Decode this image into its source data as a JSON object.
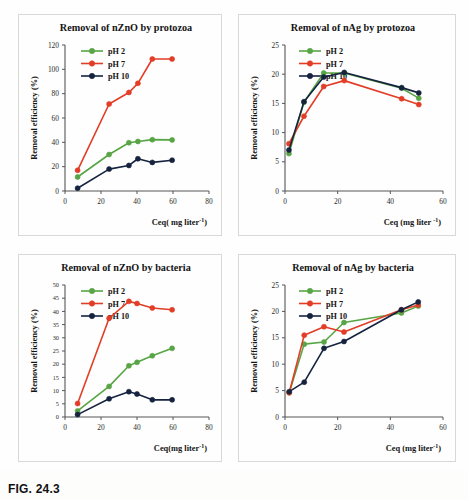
{
  "figure": {
    "caption": "FIG. 24.3",
    "series_colors": {
      "pH 2": "#57a544",
      "pH 7": "#e23d26",
      "pH 10": "#16233f"
    }
  },
  "panels": [
    {
      "id": "nzno-protozoa",
      "title": "Removal of nZnO by protozoa",
      "xlabel": "Ceq( mg liter-1)",
      "ylabel": "Removal efficiency (%)",
      "legend": [
        "pH 2",
        "pH 7",
        "pH 10"
      ]
    },
    {
      "id": "nag-protozoa",
      "title": "Removal of nAg by protozoa",
      "xlabel": "Ceq (mg liter -1)",
      "ylabel": "Removal efficiency (%)",
      "legend": [
        "pH 2",
        "pH 7",
        "pH 10"
      ]
    },
    {
      "id": "nzno-bacteria",
      "title": "Removal of nZnO by bacteria",
      "xlabel": "Ceq(mg liter-1)",
      "ylabel": "Removal efficiency (%)",
      "legend": [
        "pH 2",
        "pH 7",
        "pH 10"
      ]
    },
    {
      "id": "nag-bacteria",
      "title": "Removal of nAg by bacteria",
      "xlabel": "Ceq (mg liter-1)",
      "ylabel": "Removal efficiency (%)",
      "legend": [
        "pH 2",
        "pH 7",
        "pH 10"
      ]
    }
  ],
  "chart_data": [
    {
      "type": "line",
      "id": "nzno-protozoa",
      "title": "Removal of nZnO by protozoa",
      "xlabel": "Ceq( mg liter-1)",
      "ylabel": "Removal efficiency (%)",
      "xlim": [
        0,
        80
      ],
      "ylim": [
        0,
        120
      ],
      "xticks": [
        0,
        20,
        40,
        60,
        80
      ],
      "yticks": [
        0,
        20,
        40,
        60,
        80,
        100,
        120
      ],
      "grid": false,
      "legend_position": "top-left",
      "series": [
        {
          "name": "pH 2",
          "color": "#57a544",
          "x": [
            7,
            24.5,
            35.5,
            40.5,
            48.5,
            59.5
          ],
          "values": [
            11.5,
            30.0,
            39.7,
            40.7,
            42.2,
            42.0
          ]
        },
        {
          "name": "pH 7",
          "color": "#e23d26",
          "x": [
            7,
            24.5,
            35.5,
            40.5,
            48.5,
            59.5
          ],
          "values": [
            17.0,
            71.5,
            81.0,
            88.5,
            108.5,
            108.5
          ]
        },
        {
          "name": "pH 10",
          "color": "#16233f",
          "x": [
            7,
            24.5,
            35.5,
            40.5,
            48.5,
            59.5
          ],
          "values": [
            2.3,
            18.0,
            21.0,
            26.5,
            23.5,
            25.3
          ]
        }
      ]
    },
    {
      "type": "line",
      "id": "nag-protozoa",
      "title": "Removal of nAg by protozoa",
      "xlabel": "Ceq (mg liter -1)",
      "ylabel": "Removal efficiency (%)",
      "xlim": [
        0,
        60
      ],
      "ylim": [
        0,
        25
      ],
      "xticks": [
        0,
        20,
        40,
        60
      ],
      "yticks": [
        0,
        5,
        10,
        15,
        20,
        25
      ],
      "grid": false,
      "legend_position": "top-left",
      "series": [
        {
          "name": "pH 2",
          "color": "#57a544",
          "x": [
            1.5,
            7.2,
            14.7,
            22.5,
            44.3,
            50.8
          ],
          "values": [
            6.4,
            15.2,
            20.2,
            20.2,
            17.6,
            15.9
          ]
        },
        {
          "name": "pH 7",
          "color": "#e23d26",
          "x": [
            1.5,
            7.2,
            14.7,
            22.5,
            44.3,
            50.8
          ],
          "values": [
            8.1,
            12.8,
            17.9,
            18.9,
            15.8,
            14.8
          ]
        },
        {
          "name": "pH 10",
          "color": "#16233f",
          "x": [
            1.5,
            7.2,
            14.7,
            22.5,
            44.3,
            50.8
          ],
          "values": [
            7.0,
            15.3,
            19.5,
            20.3,
            17.7,
            16.8
          ]
        }
      ]
    },
    {
      "type": "line",
      "id": "nzno-bacteria",
      "title": "Removal of nZnO by bacteria",
      "xlabel": "Ceq(mg liter-1)",
      "ylabel": "Removal efficiency (%)",
      "xlim": [
        0,
        80
      ],
      "ylim": [
        0,
        50
      ],
      "xticks": [
        0,
        20,
        40,
        60,
        80
      ],
      "yticks": [
        0,
        5,
        10,
        15,
        20,
        25,
        30,
        35,
        40,
        45,
        50
      ],
      "grid": false,
      "legend_position": "top-left",
      "series": [
        {
          "name": "pH 2",
          "color": "#57a544",
          "x": [
            7,
            24.5,
            35.5,
            40.0,
            48.5,
            59.5
          ],
          "values": [
            2.3,
            11.6,
            19.4,
            20.7,
            23.2,
            26.0
          ]
        },
        {
          "name": "pH 7",
          "color": "#e23d26",
          "x": [
            7,
            24.5,
            35.5,
            40.0,
            48.5,
            59.5
          ],
          "values": [
            5.1,
            37.4,
            43.8,
            43.0,
            41.3,
            40.6
          ]
        },
        {
          "name": "pH 10",
          "color": "#16233f",
          "x": [
            7,
            24.5,
            35.5,
            40.0,
            48.5,
            59.5
          ],
          "values": [
            0.9,
            6.9,
            9.6,
            8.7,
            6.5,
            6.5
          ]
        }
      ]
    },
    {
      "type": "line",
      "id": "nag-bacteria",
      "title": "Removal of nAg by bacteria",
      "xlabel": "Ceq (mg liter-1)",
      "ylabel": "Removal efficiency (%)",
      "xlim": [
        0,
        60
      ],
      "ylim": [
        0,
        25
      ],
      "xticks": [
        0,
        20,
        40,
        60
      ],
      "yticks": [
        0,
        5,
        10,
        15,
        20,
        25
      ],
      "grid": false,
      "legend_position": "top-left",
      "series": [
        {
          "name": "pH 2",
          "color": "#57a544",
          "x": [
            1.6,
            7.3,
            14.8,
            22.4,
            44.2,
            50.6
          ],
          "values": [
            4.6,
            13.8,
            14.2,
            17.9,
            19.7,
            21.0
          ]
        },
        {
          "name": "pH 7",
          "color": "#e23d26",
          "x": [
            1.6,
            7.3,
            14.8,
            22.4,
            44.2,
            50.6
          ],
          "values": [
            4.6,
            15.5,
            17.1,
            16.1,
            20.3,
            21.2
          ]
        },
        {
          "name": "pH 10",
          "color": "#16233f",
          "x": [
            1.6,
            7.3,
            14.8,
            22.4,
            44.2,
            50.6
          ],
          "values": [
            4.8,
            6.6,
            13.0,
            14.3,
            20.3,
            21.8
          ]
        }
      ]
    }
  ]
}
